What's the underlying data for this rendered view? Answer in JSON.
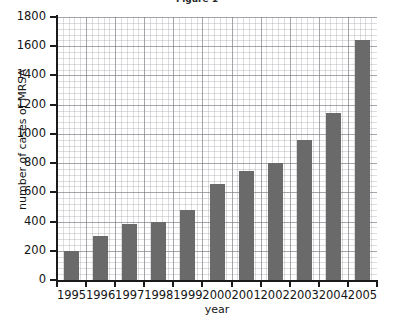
{
  "chart_data": {
    "type": "bar",
    "title": "Figure 1",
    "xlabel": "year",
    "ylabel": "number of cases of MRSA",
    "categories": [
      "1995",
      "1996",
      "1997",
      "1998",
      "1999",
      "2000",
      "2001",
      "2002",
      "2003",
      "2004",
      "2005"
    ],
    "values": [
      200,
      300,
      385,
      400,
      480,
      660,
      745,
      800,
      960,
      1145,
      1645
    ],
    "ylim": [
      0,
      1800
    ],
    "y_ticks": [
      "0",
      "200",
      "400",
      "600",
      "800",
      "1000",
      "1200",
      "1400",
      "1600",
      "1800"
    ],
    "y_tick_values": [
      0,
      200,
      400,
      600,
      800,
      1000,
      1200,
      1400,
      1600,
      1800
    ],
    "y_major_step": 200,
    "y_minor_step": 40,
    "grid": true,
    "grid_style": "graph-paper minor and major gridlines",
    "legend": null,
    "legend_position": "none",
    "series": [
      {
        "name": "number of cases of MRSA",
        "values": [
          200,
          300,
          385,
          400,
          480,
          660,
          745,
          800,
          960,
          1145,
          1645
        ]
      }
    ],
    "colors": {
      "bar": "#6a6a6a",
      "axis": "#1a1a1a",
      "grid_major": "#7878805e",
      "grid_minor": "#969698",
      "background": "#ffffff",
      "text": "#141414"
    }
  }
}
